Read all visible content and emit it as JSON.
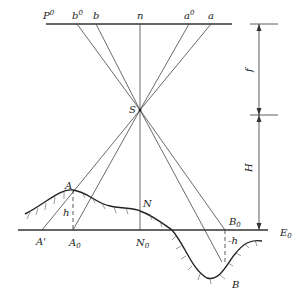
{
  "diagram": {
    "labels": {
      "P0": "P",
      "P0_sup": "0",
      "b0": "b",
      "b0_sup": "0",
      "b": "b",
      "n": "n",
      "a0": "a",
      "a0_sup": "0",
      "a": "a",
      "S": "S",
      "f": "f",
      "H": "H",
      "A": "A",
      "h": "h",
      "N": "N",
      "A_prime": "A'",
      "A0": "A",
      "A0_sub": "0",
      "N0": "N",
      "N0_sub": "0",
      "B0": "B",
      "B0_sub": "0",
      "E0": "E",
      "E0_sub": "0",
      "neg_h": "-h",
      "B": "B"
    },
    "colors": {
      "line": "#333333",
      "text": "#222222",
      "background": "#ffffff"
    }
  }
}
